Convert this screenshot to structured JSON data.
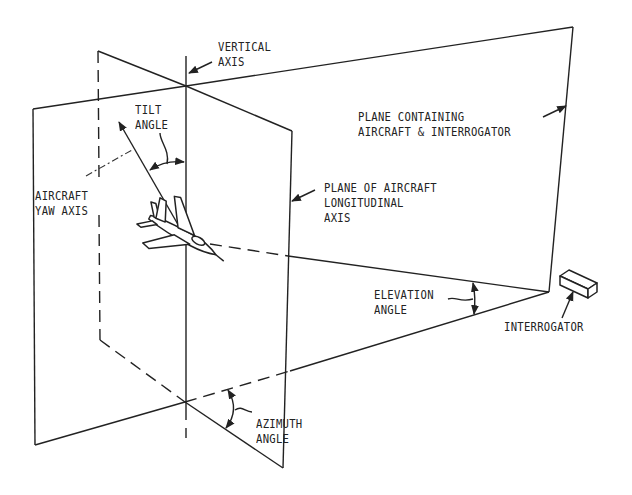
{
  "diagram": {
    "colors": {
      "line": "#222222",
      "background": "#ffffff"
    },
    "labels": {
      "vertical_axis": [
        "VERTICAL",
        "AXIS"
      ],
      "tilt_angle": [
        "TILT",
        "ANGLE"
      ],
      "aircraft_yaw_axis": [
        "AIRCRAFT",
        "YAW AXIS"
      ],
      "plane_containing": [
        "PLANE CONTAINING",
        "AIRCRAFT & INTERROGATOR"
      ],
      "plane_of_aircraft": [
        "PLANE OF AIRCRAFT",
        "LONGITUDINAL",
        "AXIS"
      ],
      "elevation_angle": [
        "ELEVATION",
        "ANGLE"
      ],
      "interrogator": [
        "INTERROGATOR"
      ],
      "azimuth_angle": [
        "AZIMUTH",
        "ANGLE"
      ]
    },
    "elements": {
      "aircraft": "aircraft-icon",
      "interrogator_box": "interrogator-box-icon"
    }
  }
}
